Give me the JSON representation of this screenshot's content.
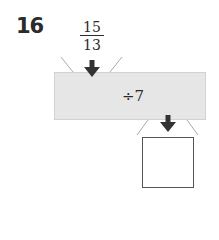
{
  "problem": {
    "number": "16",
    "input": {
      "numerator": "15",
      "denominator": "13"
    },
    "operation": "÷7",
    "answer": ""
  },
  "colors": {
    "box_fill": "#e6e6e6",
    "text": "#2b2b2b",
    "arrow": "#333333",
    "funnel_lines": "#aaaaaa"
  },
  "icons": {
    "input_arrow": "arrow-down-icon",
    "output_arrow": "arrow-down-icon"
  }
}
